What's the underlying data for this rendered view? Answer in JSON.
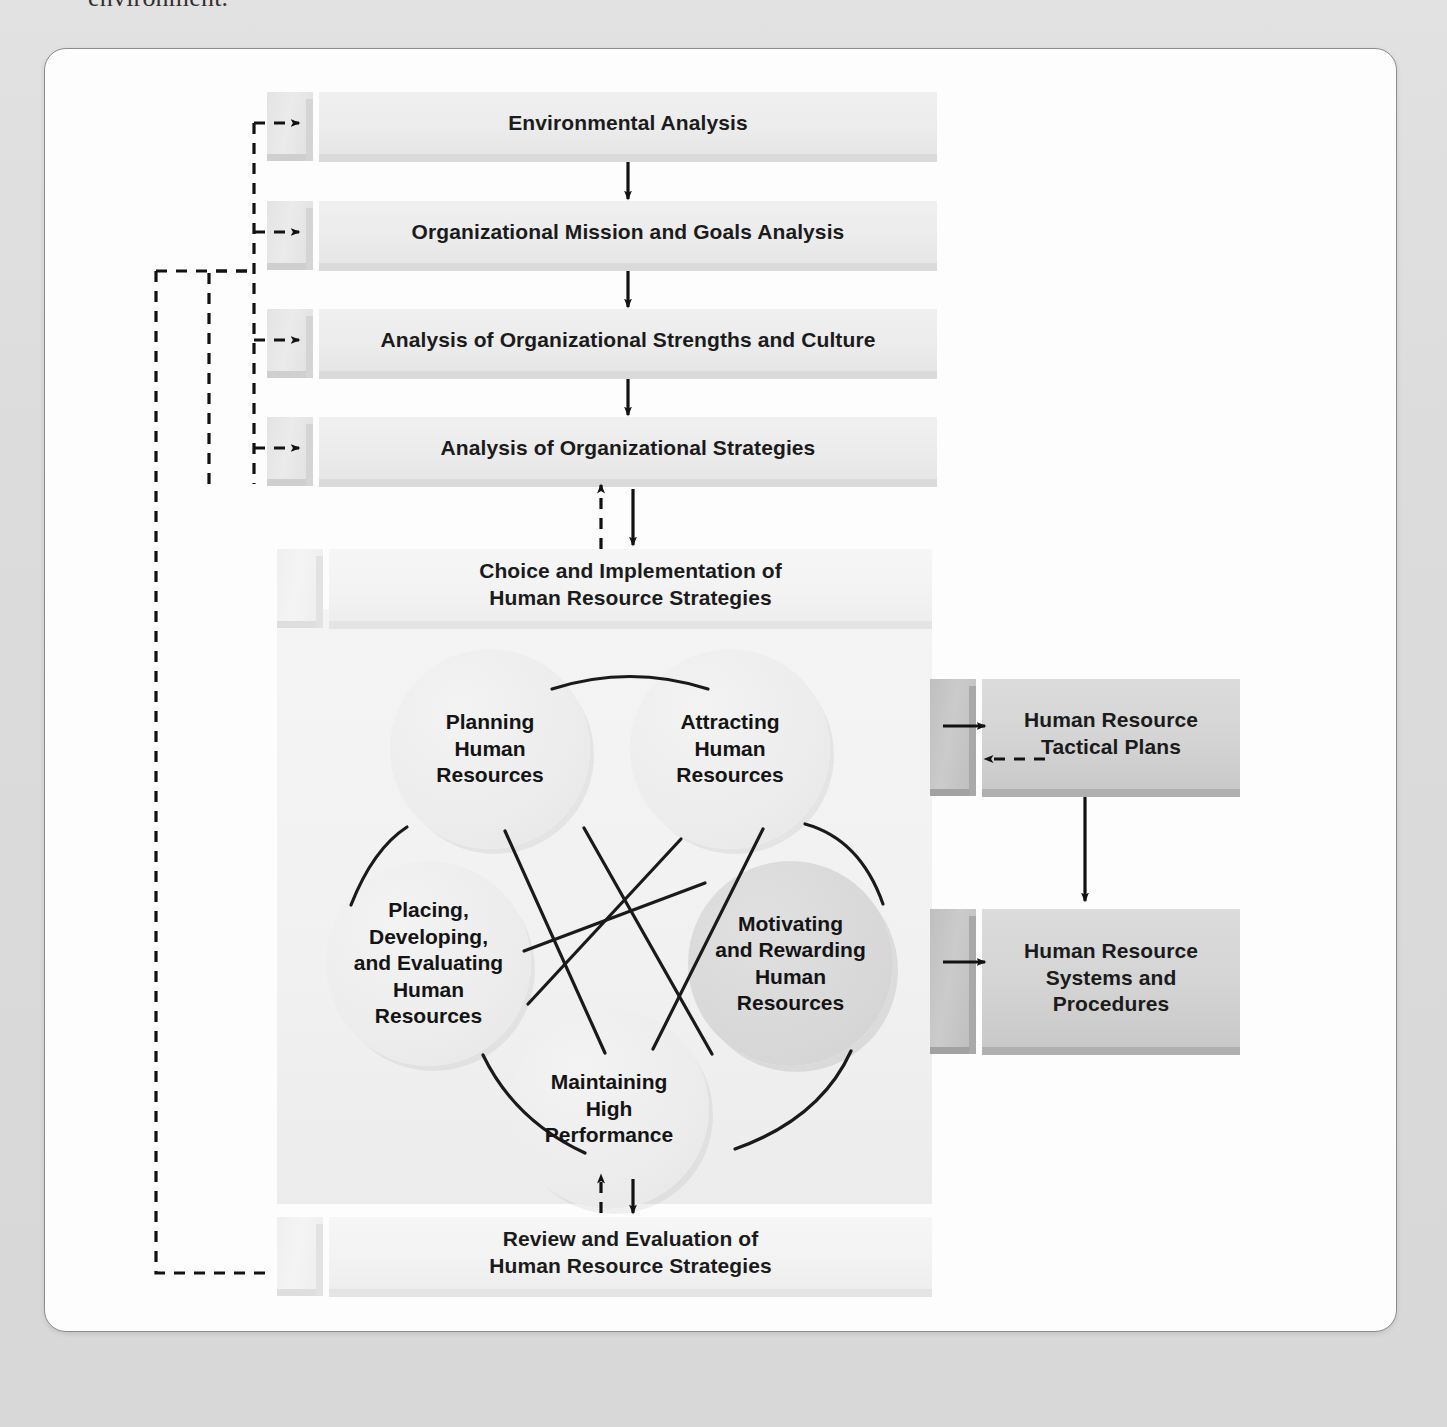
{
  "page": {
    "caption_fragment": "environment.",
    "background_color": "#dfdfdf",
    "frame_color": "#fdfdfd"
  },
  "diagram": {
    "type": "flowchart",
    "process_boxes": [
      {
        "id": "env",
        "label": "Environmental Analysis"
      },
      {
        "id": "mission",
        "label": "Organizational Mission and Goals Analysis"
      },
      {
        "id": "strengths",
        "label": "Analysis of Organizational Strengths and Culture"
      },
      {
        "id": "strategies",
        "label": "Analysis of Organizational Strategies"
      }
    ],
    "choice_box": {
      "id": "choice",
      "line1": "Choice and Implementation of",
      "line2": "Human Resource Strategies"
    },
    "review_box": {
      "id": "review",
      "line1": "Review and Evaluation of",
      "line2": "Human Resource Strategies"
    },
    "circles": [
      {
        "id": "planning",
        "lines": [
          "Planning",
          "Human",
          "Resources"
        ],
        "accent": false
      },
      {
        "id": "attracting",
        "lines": [
          "Attracting",
          "Human",
          "Resources"
        ],
        "accent": false
      },
      {
        "id": "motivating",
        "lines": [
          "Motivating",
          "and Rewarding",
          "Human",
          "Resources"
        ],
        "accent": true
      },
      {
        "id": "maintaining",
        "lines": [
          "Maintaining",
          "High",
          "Performance"
        ],
        "accent": false
      },
      {
        "id": "placing",
        "lines": [
          "Placing,",
          "Developing,",
          "and Evaluating",
          "Human",
          "Resources"
        ],
        "accent": false
      }
    ],
    "output_boxes": [
      {
        "id": "tactical",
        "line1": "Human Resource",
        "line2": "Tactical Plans",
        "line3": ""
      },
      {
        "id": "systems",
        "line1": "Human Resource",
        "line2": "Systems and",
        "line3": "Procedures"
      }
    ],
    "connectors": {
      "solid_arrow": "solid-arrow",
      "dashed_arrow": "dashed-feedback-arrow",
      "chord": "circle-chord-line",
      "arc": "circle-arc-line"
    },
    "colors": {
      "box_face": "#e6e6e6",
      "box_tab": "#d4d4d4",
      "box_dark_face": "#d4d4d4",
      "circle_fill": "#ededed",
      "circle_accent_fill": "#d9d9d9",
      "line": "#1a1a1a",
      "text": "#141414"
    }
  }
}
